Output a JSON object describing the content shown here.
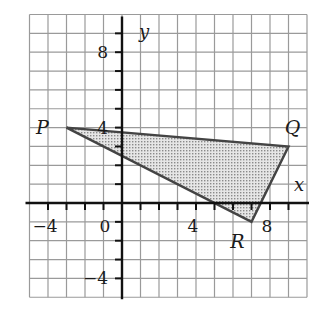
{
  "diagram": {
    "type": "coordinate-plane-triangle",
    "x_range": [
      -5,
      10
    ],
    "y_range": [
      -5,
      10
    ],
    "grid_step": 1,
    "axis_labels": {
      "x": "x",
      "y": "y"
    },
    "x_tick_labels": [
      {
        "value": -4,
        "text": "−4"
      },
      {
        "value": 0,
        "text": "0"
      },
      {
        "value": 4,
        "text": "4"
      },
      {
        "value": 8,
        "text": "8"
      }
    ],
    "y_tick_labels": [
      {
        "value": 8,
        "text": "8"
      },
      {
        "value": 4,
        "text": "4"
      },
      {
        "value": -4,
        "text": "−4"
      }
    ],
    "vertices": [
      {
        "name": "P",
        "x": -3,
        "y": 4
      },
      {
        "name": "Q",
        "x": 9,
        "y": 3
      },
      {
        "name": "R",
        "x": 7,
        "y": -1
      }
    ],
    "fill": "dotted-gray",
    "colors": {
      "grid": "#9a9a9a",
      "axis": "#111111",
      "triangle_edge": "#444444",
      "triangle_fill": "#c8c8c8"
    }
  }
}
